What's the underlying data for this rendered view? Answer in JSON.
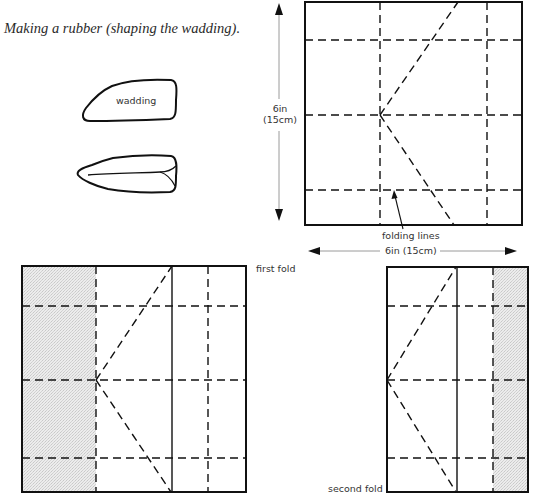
{
  "caption": "Making a rubber (shaping the wadding).",
  "wadding": {
    "label": "wadding"
  },
  "top_square": {
    "height_label_line1": "6in",
    "height_label_line2": "(15cm)",
    "width_label": "6in (15cm)",
    "pointer_label": "folding lines"
  },
  "first_fold": {
    "label": "first fold"
  },
  "second_fold": {
    "label": "second fold"
  },
  "colors": {
    "line": "#111111",
    "shade": "#e4e4e4",
    "dim_line": "#9a9a9a"
  }
}
